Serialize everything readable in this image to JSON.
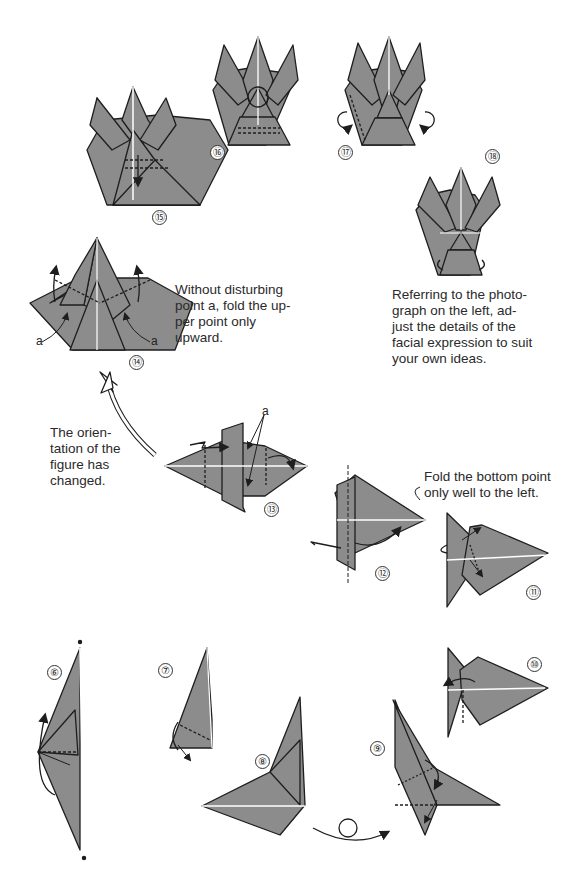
{
  "page": {
    "type": "origami instruction diagram page",
    "paper_color": "#8c8c8c",
    "line_color": "#1e1e1e"
  },
  "steps": [
    {
      "number": "⑥",
      "id": 6
    },
    {
      "number": "⑦",
      "id": 7
    },
    {
      "number": "⑧",
      "id": 8
    },
    {
      "number": "⑨",
      "id": 9
    },
    {
      "number": "⑩",
      "id": 10
    },
    {
      "number": "⑪",
      "id": 11
    },
    {
      "number": "⑫",
      "id": 12
    },
    {
      "number": "⑬",
      "id": 13
    },
    {
      "number": "⑭",
      "id": 14
    },
    {
      "number": "⑮",
      "id": 15
    },
    {
      "number": "⑯",
      "id": 16
    },
    {
      "number": "⑰",
      "id": 17
    },
    {
      "number": "⑱",
      "id": 18
    }
  ],
  "captions": {
    "step14": "Without disturbing\npoint a, fold the up-\nper point only\nupward.",
    "step18": "Referring to the photo-\ngraph on the left, ad-\njust the details of the\nfacial expression to suit\nyour own ideas.",
    "orientation": "The orien-\ntation of the\nfigure has\nchanged.",
    "step12": "Fold the bottom point\nonly well to the left."
  },
  "labels": {
    "point_a": "a"
  }
}
